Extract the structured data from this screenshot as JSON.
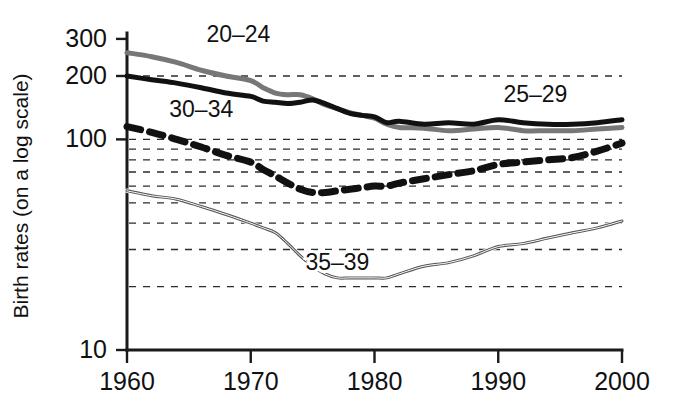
{
  "chart_data": {
    "type": "line",
    "title": "",
    "xlabel": "",
    "ylabel": "Birth rates (on a log scale)",
    "yscale": "log",
    "ylim": [
      10,
      320
    ],
    "xlim": [
      1960,
      2000
    ],
    "grid": true,
    "grid_values": [
      200,
      100,
      90,
      80,
      70,
      60,
      50,
      40,
      30,
      20
    ],
    "legend_position": "inline-annotations",
    "y_tick_labels": [
      "300",
      "200",
      "100",
      "10"
    ],
    "y_ticks": [
      300,
      200,
      100,
      10
    ],
    "x_ticks": [
      1960,
      1970,
      1980,
      1990,
      2000
    ],
    "x_tick_labels": [
      "1960",
      "1970",
      "1980",
      "1990",
      "2000"
    ],
    "x": [
      1960,
      1962,
      1964,
      1966,
      1968,
      1970,
      1971,
      1972,
      1973,
      1974,
      1975,
      1976,
      1977,
      1978,
      1979,
      1980,
      1981,
      1982,
      1984,
      1986,
      1988,
      1990,
      1992,
      1994,
      1996,
      1998,
      2000
    ],
    "series": [
      {
        "name": "20-24",
        "label": "20–24",
        "color": "#777777",
        "style": "solid",
        "width": 5,
        "label_x": 1969,
        "label_value": 290,
        "values": [
          258,
          247,
          232,
          213,
          200,
          190,
          176,
          166,
          163,
          163,
          156,
          146,
          140,
          134,
          130,
          126,
          118,
          114,
          113,
          110,
          112,
          114,
          110,
          110,
          110,
          112,
          114
        ]
      },
      {
        "name": "25-29",
        "label": "25–29",
        "color": "#111111",
        "style": "solid",
        "width": 5,
        "label_x": 1993,
        "label_value": 150,
        "values": [
          200,
          192,
          185,
          176,
          166,
          160,
          152,
          150,
          148,
          150,
          154,
          148,
          140,
          133,
          130,
          128,
          120,
          122,
          118,
          120,
          118,
          124,
          120,
          118,
          118,
          120,
          124
        ]
      },
      {
        "name": "30-34",
        "label": "30–34",
        "color": "#111111",
        "style": "dashed",
        "width": 7,
        "label_x": 1966,
        "label_value": 128,
        "values": [
          115,
          108,
          100,
          92,
          84,
          78,
          72,
          67,
          62,
          58,
          56,
          56,
          57,
          58,
          59,
          60,
          60,
          62,
          65,
          68,
          71,
          76,
          78,
          80,
          82,
          88,
          96
        ]
      },
      {
        "name": "35-39",
        "label": "35–39",
        "color": "#555555",
        "style": "solid",
        "width": 3,
        "label_x": 1977,
        "label_value": 24,
        "values": [
          57,
          54,
          52,
          48,
          44,
          40,
          38,
          36,
          32,
          28,
          25,
          23,
          22,
          22,
          22,
          22,
          22,
          23,
          25,
          26,
          28,
          31,
          32,
          34,
          36,
          38,
          41
        ]
      }
    ]
  },
  "figure": {
    "plot_left": 127,
    "plot_right": 622,
    "plot_top": 33,
    "plot_bottom": 350
  }
}
